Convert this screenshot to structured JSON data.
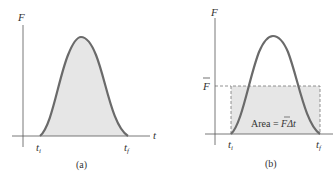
{
  "colors": {
    "axis": "#555555",
    "curve": "#6a6a6a",
    "fill": "#e6e6e6",
    "dashed": "#777777",
    "text": "#333333"
  },
  "panel_a": {
    "y_axis_label": "F",
    "x_axis_label": "t",
    "tick_start": "t",
    "tick_start_sub": "i",
    "tick_end": "t",
    "tick_end_sub": "f",
    "caption": "(a)"
  },
  "panel_b": {
    "y_axis_label": "F",
    "fbar_label": "F",
    "tick_start": "t",
    "tick_start_sub": "i",
    "tick_end": "t",
    "tick_end_sub": "f",
    "area_label_prefix": "Area = ",
    "area_label_fbar": "F",
    "area_label_suffix": "Δt",
    "caption": "(b)"
  }
}
